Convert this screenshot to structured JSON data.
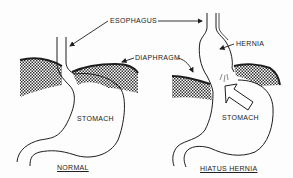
{
  "labels": {
    "esophagus": "ESOPHAGUS",
    "diaphragm": "DIAPHRAGM",
    "hernia": "HERNIA",
    "stomach_normal": "STOMACH",
    "stomach_hernia": "STOMACH",
    "caption_normal": "NORMAL",
    "caption_hernia": "HIATUS HERNIA"
  },
  "colors": {
    "ink": "#1e1e1e",
    "background": "#fdfdfd"
  }
}
